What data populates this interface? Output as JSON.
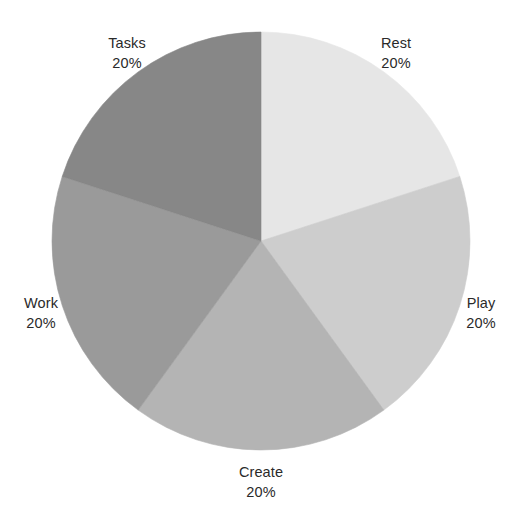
{
  "figure": {
    "width": 521,
    "height": 521,
    "background_color": "#ffffff",
    "text_color": "#2a2a2a"
  },
  "chart_data": {
    "type": "pie",
    "title": "",
    "xlabel": "",
    "ylabel": "",
    "grid": false,
    "legend": "none",
    "labels_position": "outside",
    "start_angle_deg": 90,
    "direction": "clockwise",
    "center": {
      "x": 261,
      "y": 241
    },
    "radius": 209,
    "categories": [
      "Rest",
      "Play",
      "Create",
      "Work",
      "Tasks"
    ],
    "values": [
      20,
      20,
      20,
      20,
      20
    ],
    "value_labels": [
      "20%",
      "20%",
      "20%",
      "20%",
      "20%"
    ],
    "colors": [
      "#e6e6e6",
      "#cdcdcd",
      "#b4b4b4",
      "#9a9a9a",
      "#878787"
    ],
    "slices": [
      {
        "name": "Rest",
        "value": 20,
        "value_label": "20%",
        "color": "#e6e6e6",
        "start_angle_deg": 90,
        "end_angle_deg": 18,
        "label_x": 396,
        "label_y": 53
      },
      {
        "name": "Play",
        "value": 20,
        "value_label": "20%",
        "color": "#cdcdcd",
        "start_angle_deg": 18,
        "end_angle_deg": -54,
        "label_x": 481,
        "label_y": 313
      },
      {
        "name": "Create",
        "value": 20,
        "value_label": "20%",
        "color": "#b4b4b4",
        "start_angle_deg": -54,
        "end_angle_deg": -126,
        "label_x": 261,
        "label_y": 482
      },
      {
        "name": "Work",
        "value": 20,
        "value_label": "20%",
        "color": "#9a9a9a",
        "start_angle_deg": -126,
        "end_angle_deg": -198,
        "label_x": 41,
        "label_y": 313
      },
      {
        "name": "Tasks",
        "value": 20,
        "value_label": "20%",
        "color": "#878787",
        "start_angle_deg": -198,
        "end_angle_deg": -270,
        "label_x": 127,
        "label_y": 53
      }
    ]
  }
}
